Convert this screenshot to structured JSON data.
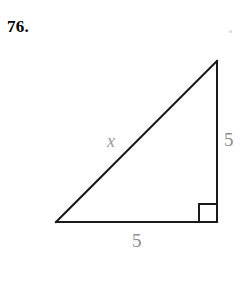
{
  "page": {
    "background_color": "#ffffff",
    "width": 247,
    "height": 295
  },
  "problem": {
    "number_label": "76.",
    "number_color": "#000000"
  },
  "figure": {
    "type": "right-triangle",
    "stroke_color": "#1a1a1a",
    "stroke_width": 2,
    "label_color": "#8e8e8e",
    "vertices": {
      "apex": {
        "x": 217,
        "y": 61
      },
      "bottom_left": {
        "x": 56,
        "y": 222
      },
      "bottom_right": {
        "x": 217,
        "y": 222
      }
    },
    "right_angle_marker": {
      "at_vertex": "bottom_right",
      "size": 18
    },
    "labels": {
      "vertical_leg": "5",
      "horizontal_leg": "5",
      "hypotenuse": "x"
    }
  }
}
